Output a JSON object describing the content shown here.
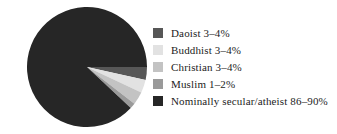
{
  "chart_data": {
    "type": "pie",
    "title": "",
    "subtitle": "",
    "xlabel": "",
    "ylabel": "",
    "grid": false,
    "legend_position": "right",
    "categories": [
      "Daoist",
      "Buddhist",
      "Christian",
      "Muslim",
      "Nominally secular/atheist"
    ],
    "value_labels": [
      "3–4%",
      "3–4%",
      "3–4%",
      "1–2%",
      "86–90%"
    ],
    "values": [
      3.5,
      3.5,
      3.5,
      1.5,
      88.0
    ],
    "colors": [
      "#575757",
      "#e2e2e2",
      "#c3c3c3",
      "#9a9a9a",
      "#262626"
    ],
    "slices": [
      {
        "name": "Daoist",
        "label": "Daoist 3–4%",
        "value": 3.5,
        "range": [
          3,
          4
        ],
        "color": "#575757"
      },
      {
        "name": "Buddhist",
        "label": "Buddhist 3–4%",
        "value": 3.5,
        "range": [
          3,
          4
        ],
        "color": "#e2e2e2"
      },
      {
        "name": "Christian",
        "label": "Christian 3–4%",
        "value": 3.5,
        "range": [
          3,
          4
        ],
        "color": "#c3c3c3"
      },
      {
        "name": "Muslim",
        "label": "Muslim 1–2%",
        "value": 1.5,
        "range": [
          1,
          2
        ],
        "color": "#9a9a9a"
      },
      {
        "name": "Nominally secular/atheist",
        "label": "Nominally secular/atheist 86–90%",
        "value": 88.0,
        "range": [
          86,
          90
        ],
        "color": "#262626"
      }
    ]
  },
  "legend": {
    "items": [
      {
        "label": "Daoist 3–4%",
        "color": "#575757"
      },
      {
        "label": "Buddhist 3–4%",
        "color": "#e2e2e2"
      },
      {
        "label": "Christian 3–4%",
        "color": "#c3c3c3"
      },
      {
        "label": "Muslim 1–2%",
        "color": "#9a9a9a"
      },
      {
        "label": "Nominally secular/atheist 86–90%",
        "color": "#262626"
      }
    ]
  }
}
